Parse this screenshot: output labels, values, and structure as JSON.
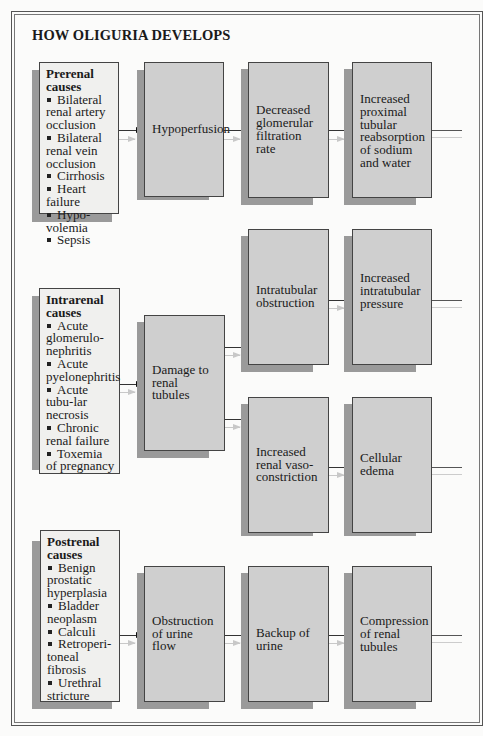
{
  "title": "HOW OLIGURIA DEVELOPS",
  "rows": [
    {
      "cause": {
        "heading": "Prerenal causes",
        "items": [
          "Bilateral renal artery occlusion",
          "Bilateral renal vein occlusion",
          "Cirrhosis",
          "Heart failure",
          "Hypo-volemia",
          "Sepsis"
        ]
      },
      "steps": [
        "Hypoperfusion",
        "Decreased glomerular filtration rate",
        "Increased proximal tubular reabsorption of sodium and water"
      ]
    },
    {
      "cause": {
        "heading": "Intrarenal causes",
        "items": [
          "Acute glomerulo-nephritis",
          "Acute pyelonephritis",
          "Acute tubu-lar necrosis",
          "Chronic renal failure",
          "Toxemia of pregnancy"
        ]
      },
      "steps": [
        "Damage to renal tubules"
      ],
      "branches": [
        [
          "Intratubular obstruction",
          "Increased intratubular pressure"
        ],
        [
          "Increased renal vaso-constriction",
          "Cellular edema"
        ]
      ]
    },
    {
      "cause": {
        "heading": "Postrenal causes",
        "items": [
          "Benign prostatic hyperplasia",
          "Bladder neoplasm",
          "Calculi",
          "Retroperi-toneal fibrosis",
          "Urethral stricture"
        ]
      },
      "steps": [
        "Obstruction of urine flow",
        "Backup of urine",
        "Compression of renal tubules"
      ]
    }
  ],
  "colors": {
    "cause_fill": "#f0f0ee",
    "process_fill": "#cfcfcf",
    "shadow": "#9a9a9a",
    "border": "#444444"
  }
}
